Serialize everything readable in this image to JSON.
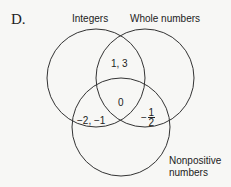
{
  "option_letter": "D.",
  "sets": {
    "left": {
      "label": "Integers"
    },
    "right": {
      "label": "Whole numbers"
    },
    "bottom": {
      "label_line1": "Nonpositive",
      "label_line2": "numbers"
    }
  },
  "regions": {
    "integers_and_whole": "1, 3",
    "all_three": "0",
    "integers_and_nonpositive": "−2, −1",
    "whole_and_nonpositive_fraction": {
      "sign": "−",
      "numerator": "1",
      "denominator": "2"
    }
  },
  "colors": {
    "stroke": "#333333",
    "text": "#222222"
  }
}
